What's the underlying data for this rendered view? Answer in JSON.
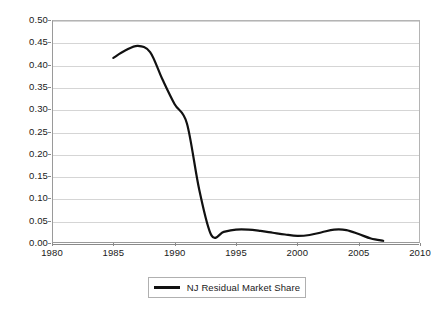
{
  "chart_data": {
    "type": "line",
    "title": "",
    "xlabel": "",
    "ylabel": "",
    "xlim": [
      1980,
      2010
    ],
    "ylim": [
      0.0,
      0.5
    ],
    "grid": true,
    "legend_position": "bottom-center",
    "x_ticks": [
      1980,
      1985,
      1990,
      1995,
      2000,
      2005,
      2010
    ],
    "x_tick_labels": [
      "1980",
      "1985",
      "1990",
      "1995",
      "2000",
      "2005",
      "2010"
    ],
    "y_ticks": [
      0.0,
      0.05,
      0.1,
      0.15,
      0.2,
      0.25,
      0.3,
      0.35,
      0.4,
      0.45,
      0.5
    ],
    "y_tick_labels": [
      "0.00",
      "0.05",
      "0.10",
      "0.15",
      "0.20",
      "0.25",
      "0.30",
      "0.35",
      "0.40",
      "0.45",
      "0.50"
    ],
    "series": [
      {
        "name": "NJ Residual Market Share",
        "color": "#111111",
        "x": [
          1985,
          1986,
          1987,
          1988,
          1989,
          1990,
          1991,
          1992,
          1993,
          1994,
          1995,
          1996,
          1997,
          1998,
          1999,
          2000,
          2001,
          2002,
          2003,
          2004,
          2005,
          2006,
          2007
        ],
        "values": [
          0.415,
          0.432,
          0.442,
          0.428,
          0.367,
          0.311,
          0.268,
          0.12,
          0.017,
          0.025,
          0.03,
          0.03,
          0.027,
          0.023,
          0.019,
          0.016,
          0.018,
          0.024,
          0.03,
          0.029,
          0.02,
          0.01,
          0.005
        ]
      }
    ]
  },
  "legend": {
    "label": "NJ Residual Market Share",
    "swatch_icon": "line-swatch-icon"
  }
}
